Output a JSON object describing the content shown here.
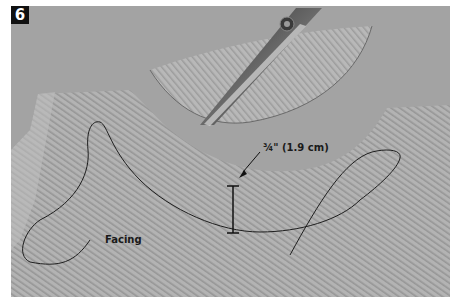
{
  "step": {
    "number": "6"
  },
  "annotations": {
    "measurement": "¾\" (1.9 cm)",
    "facing": "Facing"
  },
  "colors": {
    "background": "#a2a2a2",
    "fabric": "#b4b4b4",
    "stitch_line": "#1e1e1e",
    "badge": "#111111",
    "border": "#ffffff"
  },
  "objects": [
    "fabric-garment-piece",
    "trimmed-facing-scrap",
    "scissors",
    "stitching-line",
    "thread-tail",
    "measurement-marker"
  ]
}
